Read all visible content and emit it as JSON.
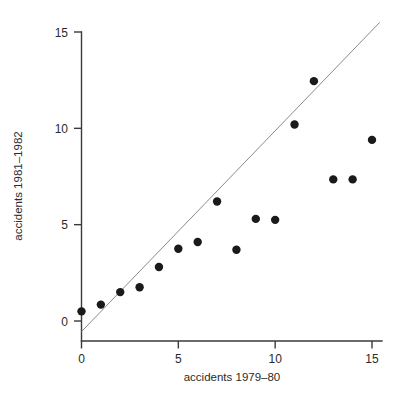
{
  "chart_data": {
    "type": "scatter",
    "title": "",
    "xlabel": "accidents 1979–80",
    "ylabel": "accidents 1981–1982",
    "xlim": [
      -0.6,
      16.2
    ],
    "ylim": [
      -0.9,
      16.2
    ],
    "xticks": [
      0,
      5,
      10,
      15
    ],
    "xticklabels": [
      "0",
      "5",
      "10",
      "15"
    ],
    "yticks": [
      0,
      5,
      10,
      15
    ],
    "yticklabels": [
      "0",
      "5",
      "10",
      "15"
    ],
    "grid": false,
    "legend": null,
    "point_color": "#1a1a1a",
    "point_size": 4.2,
    "reference_line": {
      "name": "identity-line",
      "type": "line",
      "color": "#8a8a8a",
      "x": [
        0.0,
        15.4
      ],
      "y": [
        -0.55,
        15.5
      ]
    },
    "series": [
      {
        "name": "accidents",
        "x": [
          0,
          1,
          2,
          3,
          4,
          5,
          6,
          7,
          8,
          9,
          10,
          11,
          12,
          13,
          14,
          15
        ],
        "y": [
          0.5,
          0.85,
          1.5,
          1.75,
          2.8,
          3.75,
          4.1,
          6.2,
          3.7,
          5.3,
          5.25,
          10.2,
          12.45,
          7.35,
          7.35,
          9.4
        ]
      }
    ]
  },
  "axes": {
    "x_axis_name": "x-axis",
    "y_axis_name": "y-axis"
  }
}
